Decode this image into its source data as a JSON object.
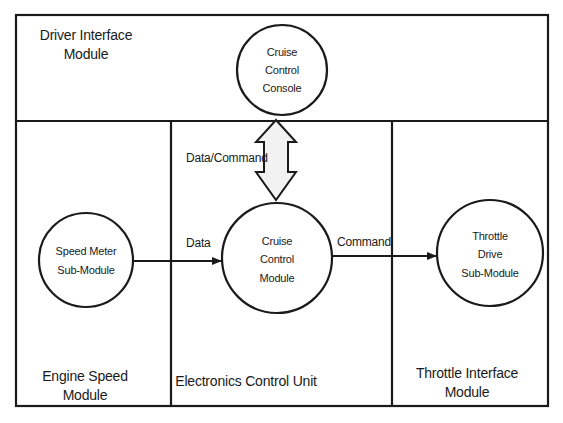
{
  "diagram": {
    "modules": {
      "driver_interface": [
        "Driver Interface",
        "Module"
      ],
      "engine_speed": [
        "Engine Speed",
        "Module"
      ],
      "ecu": [
        "Electronics Control Unit"
      ],
      "throttle_interface": [
        "Throttle Interface",
        "Module"
      ]
    },
    "nodes": {
      "cruise_console": [
        "Cruise",
        "Control",
        "Console"
      ],
      "cruise_module": [
        "Cruise",
        "Control",
        "Module"
      ],
      "speed_meter": [
        "Speed Meter",
        "Sub-Module"
      ],
      "throttle_drive": [
        "Throttle",
        "Drive",
        "Sub-Module"
      ]
    },
    "flows": {
      "console_module": "Data/Command",
      "speed_to_module": "Data",
      "module_to_throttle": "Command"
    },
    "colors": {
      "line": "#1a1a1a",
      "background": "#ffffff",
      "arrow_fill": "#f2f2f2"
    }
  }
}
